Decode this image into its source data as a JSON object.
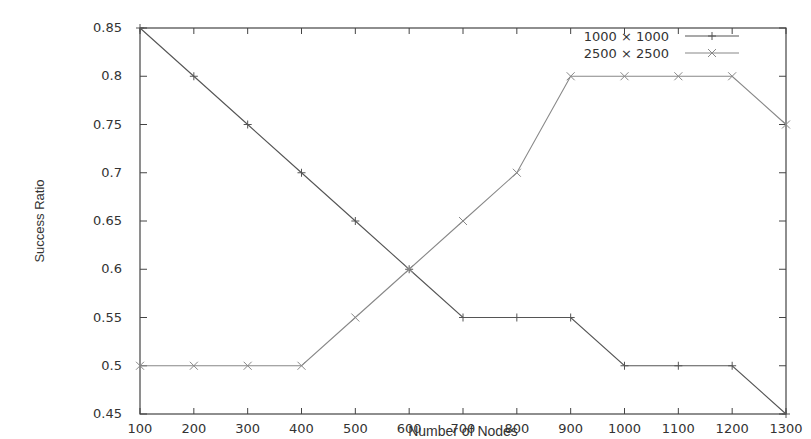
{
  "chart_data": {
    "type": "line",
    "title": "",
    "xlabel": "Number of Nodes",
    "ylabel": "Success Ratio",
    "x": [
      100,
      200,
      300,
      400,
      500,
      600,
      700,
      800,
      900,
      1000,
      1100,
      1200,
      1300
    ],
    "xlim": [
      100,
      1300
    ],
    "ylim": [
      0.45,
      0.85
    ],
    "x_ticks": [
      "100",
      "200",
      "300",
      "400",
      "500",
      "600",
      "700",
      "800",
      "900",
      "1000",
      "1100",
      "1200",
      "1300"
    ],
    "y_ticks": [
      "0.45",
      "0.5",
      "0.55",
      "0.6",
      "0.65",
      "0.7",
      "0.75",
      "0.8",
      "0.85"
    ],
    "grid": false,
    "legend_position": "top-right",
    "series": [
      {
        "name": "1000 x 1000",
        "marker": "plus",
        "values": [
          0.85,
          0.8,
          0.75,
          0.7,
          0.65,
          0.6,
          0.55,
          0.55,
          0.55,
          0.5,
          0.5,
          0.5,
          0.45
        ]
      },
      {
        "name": "2500 x 2500",
        "marker": "cross",
        "values": [
          0.5,
          0.5,
          0.5,
          0.5,
          0.55,
          0.6,
          0.65,
          0.7,
          0.8,
          0.8,
          0.8,
          0.8,
          0.75
        ]
      }
    ]
  }
}
